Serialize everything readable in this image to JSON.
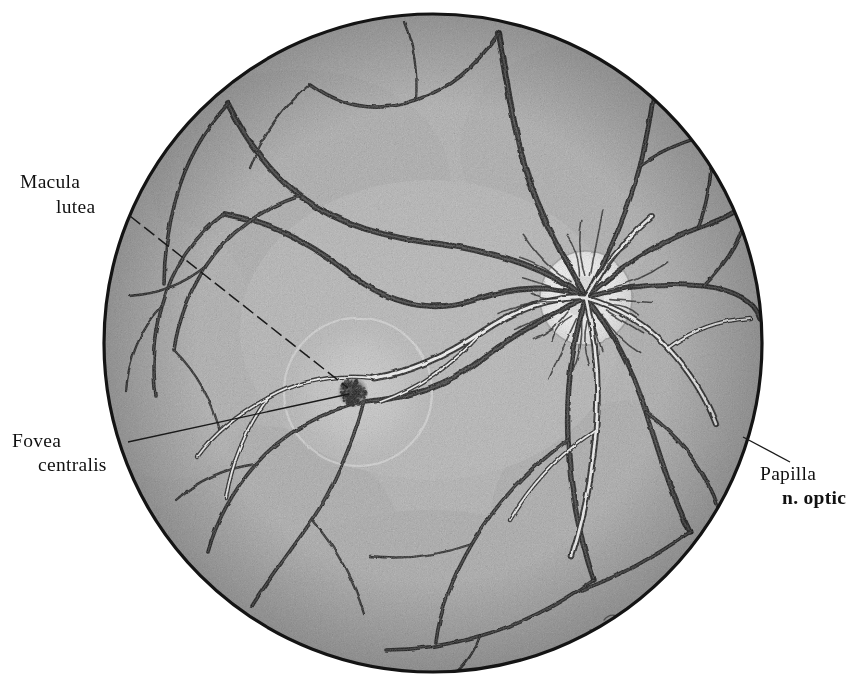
{
  "figure": {
    "kind": "anatomical-engraving",
    "canvas": {
      "width": 846,
      "height": 694,
      "background": "#ffffff"
    },
    "fundus_circle": {
      "center_x": 433,
      "center_y": 343,
      "radius": 329,
      "fill": "#b4b4b4",
      "outline": "#141414",
      "outline_width": 3.2
    },
    "palette": {
      "ink": "#141414",
      "retina_gray": "#b4b4b4",
      "retina_gray_light": "#c9c9c9",
      "retina_gray_dark": "#9a9a9a",
      "vein_dark": "#1a1a1a",
      "artery_highlight": "#ffffff",
      "disc_white": "#f4f4f4",
      "macula_halo": "#c6c6c6",
      "fovea_dark": "#2a2a2a",
      "leader_line": "#1a1a1a"
    }
  },
  "labels": [
    {
      "id": "macula-lutea",
      "lines": [
        "Macula",
        "lutea"
      ],
      "line1": "Macula",
      "line2": "lutea",
      "bold": false,
      "x1": 20,
      "y1": 188,
      "x2": 56,
      "y2": 213,
      "anchor": "start",
      "leader": {
        "style": "dashed",
        "x1": 130,
        "y1": 216,
        "x2": 348,
        "y2": 388,
        "dash": "13 5",
        "width": 1.5
      }
    },
    {
      "id": "fovea-centralis",
      "lines": [
        "Fovea",
        "centralis"
      ],
      "line1": "Fovea",
      "line2": "centralis",
      "bold": false,
      "x1": 12,
      "y1": 447,
      "x2": 38,
      "y2": 471,
      "anchor": "start",
      "leader": {
        "style": "solid",
        "x1": 128,
        "y1": 442,
        "x2": 349,
        "y2": 394,
        "dash": "none",
        "width": 1.4
      }
    },
    {
      "id": "papilla-nervi-optici",
      "lines": [
        "Papilla",
        "n. optic"
      ],
      "line1": "Papilla",
      "line2": "n. optic",
      "bold": true,
      "bold_line": 2,
      "x1": 760,
      "y1": 480,
      "x2": 782,
      "y2": 504,
      "anchor": "start",
      "clipped_right": true,
      "leader": {
        "style": "solid",
        "x1": 743,
        "y1": 437,
        "x2": 790,
        "y2": 462,
        "dash": "none",
        "width": 1.4
      }
    }
  ],
  "anatomy": {
    "optic_disc": {
      "name": "optic disc / papilla nervi optici",
      "center_x": 586,
      "center_y": 298,
      "radius_x": 44,
      "radius_y": 46,
      "tone": "bright white-gray"
    },
    "macula": {
      "name": "macula lutea",
      "center_x": 358,
      "center_y": 392,
      "radius": 72,
      "tone": "slightly lighter halo"
    },
    "fovea": {
      "name": "fovea centralis",
      "center_x": 353,
      "center_y": 392,
      "radius": 13,
      "tone": "dark stippled spot"
    },
    "signature": {
      "visible": true,
      "x": 612,
      "y": 622,
      "note": "faint engraver monogram near lower-right margin"
    }
  },
  "vessels": {
    "description": "Retinal arteries and veins radiating from the optic disc; veins drawn dark and broad, arteries carrying a white central light-reflex stripe.",
    "veins": [
      "M586 298 C 560 250, 534 206, 520 150 C 512 116, 506 76, 498 34",
      "M586 298 C 548 268, 498 252, 440 244 C 388 238, 340 226, 300 196 C 268 172, 246 140, 228 104",
      "M586 298 C 556 284, 516 286, 474 300 C 424 316, 382 300, 342 268 C 306 240, 268 222, 224 214",
      "M586 298 C 556 312, 520 330, 486 356 C 448 386, 410 398, 364 402",
      "M586 298 C 572 342, 566 390, 568 440 C 570 488, 578 534, 594 580",
      "M586 298 C 612 330, 632 368, 646 412 C 660 456, 672 496, 690 532",
      "M586 298 C 622 286, 662 282, 704 286 C 734 290, 754 300, 760 318",
      "M586 298 C 618 268, 656 244, 698 228 C 726 218, 746 208, 756 192",
      "M586 298 C 608 256, 628 212, 640 166 C 648 132, 654 100, 656 70",
      "M498 34 C 478 64, 452 88, 416 100 C 376 114, 340 106, 310 84",
      "M300 196 C 262 208, 228 232, 206 266 C 188 294, 178 322, 174 350",
      "M228 104 C 204 130, 186 162, 176 198 C 168 228, 164 256, 164 284",
      "M224 214 C 194 236, 172 268, 162 306 C 154 338, 152 368, 156 396",
      "M364 402 C 322 412, 284 432, 256 464 C 232 492, 216 522, 208 552",
      "M364 402 C 352 444, 336 484, 312 520 C 290 552, 268 580, 252 606",
      "M568 440 C 530 468, 496 502, 472 544 C 452 578, 440 610, 436 642",
      "M594 580 C 560 604, 522 624, 480 636 C 446 646, 414 650, 386 650",
      "M646 412 C 676 434, 700 462, 714 496 C 724 520, 728 542, 728 560",
      "M690 532 C 656 556, 620 576, 582 590",
      "M704 286 C 728 262, 744 234, 750 204",
      "M698 228 C 710 196, 714 162, 710 128",
      "M640 166 C 668 146, 700 134, 734 132",
      "M310 84 C 282 108, 262 136, 250 168",
      "M416 100 C 418 72, 414 46, 404 22",
      "M206 266 C 184 284, 158 294, 130 296",
      "M256 464 C 226 468, 198 480, 176 500",
      "M312 520 C 336 548, 354 580, 364 614",
      "M472 544 C 438 556, 404 560, 370 556",
      "M162 306 C 140 330, 128 360, 126 392",
      "M480 636 C 472 658, 460 672, 444 680",
      "M174 350 C 196 372, 212 400, 220 432"
    ],
    "arteries": [
      "M586 298 C 554 296, 518 308, 482 332 C 446 356, 412 372, 374 378",
      "M586 298 C 596 340, 600 384, 596 430 C 592 476, 584 518, 572 556",
      "M586 298 C 614 306, 644 322, 668 348 C 690 372, 706 398, 716 424",
      "M586 298 C 604 266, 626 238, 652 216",
      "M482 332 C 454 364, 420 388, 380 402",
      "M374 378 C 336 374, 300 380, 268 398 C 238 414, 214 434, 198 456",
      "M596 430 C 562 452, 532 482, 510 520",
      "M668 348 C 692 330, 720 320, 750 318",
      "M268 398 C 246 428, 232 462, 226 498"
    ]
  }
}
